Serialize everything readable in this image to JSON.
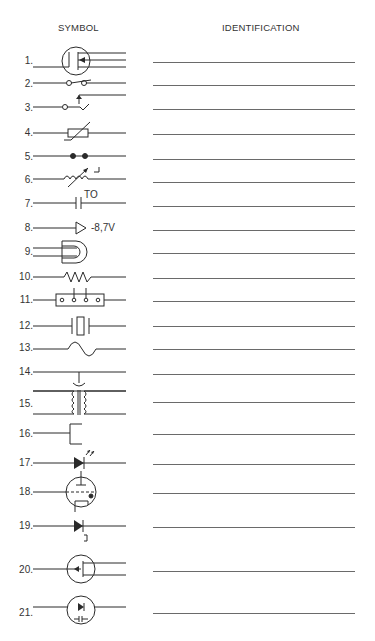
{
  "headers": {
    "symbol": "SYMBOL",
    "identification": "IDENTIFICATION"
  },
  "rows": [
    {
      "number": "1.",
      "symbol": "mosfet-circle-icon",
      "identification": ""
    },
    {
      "number": "2.",
      "symbol": "open-switch-icon",
      "identification": ""
    },
    {
      "number": "3.",
      "symbol": "switch-with-arrow-icon",
      "identification": ""
    },
    {
      "number": "4.",
      "symbol": "variable-resistor-box-icon",
      "identification": ""
    },
    {
      "number": "5.",
      "symbol": "two-dots-contacts-icon",
      "identification": ""
    },
    {
      "number": "6.",
      "symbol": "variable-inductor-icon",
      "identification": ""
    },
    {
      "number": "7.",
      "symbol": "capacitor-to-icon",
      "identification": "",
      "label": "TO"
    },
    {
      "number": "8.",
      "symbol": "triangle-voltage-icon",
      "identification": "",
      "label": "-8,7V"
    },
    {
      "number": "9.",
      "symbol": "and-gate-icon",
      "identification": ""
    },
    {
      "number": "10.",
      "symbol": "resistor-icon",
      "identification": ""
    },
    {
      "number": "11.",
      "symbol": "terminal-strip-icon",
      "identification": ""
    },
    {
      "number": "12.",
      "symbol": "crystal-icon",
      "identification": ""
    },
    {
      "number": "13.",
      "symbol": "fuse-icon",
      "identification": ""
    },
    {
      "number": "14.",
      "symbol": "crossing-wires-icon",
      "identification": ""
    },
    {
      "number": "15.",
      "symbol": "transformer-icon",
      "identification": ""
    },
    {
      "number": "16.",
      "symbol": "e-bracket-icon",
      "identification": ""
    },
    {
      "number": "17.",
      "symbol": "led-icon",
      "identification": ""
    },
    {
      "number": "18.",
      "symbol": "vacuum-tube-icon",
      "identification": ""
    },
    {
      "number": "19.",
      "symbol": "diode-icon",
      "identification": ""
    },
    {
      "number": "20.",
      "symbol": "fet-circle-icon",
      "identification": ""
    },
    {
      "number": "21.",
      "symbol": "diode-in-circle-icon",
      "identification": ""
    }
  ]
}
